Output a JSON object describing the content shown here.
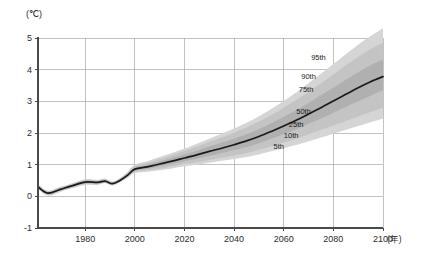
{
  "chart_data": {
    "type": "area",
    "title": "",
    "subtitle": "",
    "xlabel": "(年)",
    "ylabel": "(℃)",
    "yunit": "℃",
    "xunit": "年",
    "xlim": [
      1961,
      2100
    ],
    "ylim": [
      -1,
      5
    ],
    "xticks": [
      1980,
      2000,
      2020,
      2040,
      2060,
      2080,
      2100
    ],
    "xtick_labels": [
      "1980",
      "2000",
      "2020",
      "2040",
      "2060",
      "2080",
      "2100"
    ],
    "yticks": [
      -1,
      0,
      1,
      2,
      3,
      4,
      5
    ],
    "ytick_labels": [
      "-1",
      "0",
      "1",
      "2",
      "3",
      "4",
      "5"
    ],
    "grid": true,
    "legend_position": "inline-annotations",
    "annotations": [
      {
        "label": "95th",
        "x": 2074,
        "y": 4.3
      },
      {
        "label": "90th",
        "x": 2070,
        "y": 3.7
      },
      {
        "label": "75th",
        "x": 2069,
        "y": 3.3
      },
      {
        "label": "50th",
        "x": 2068,
        "y": 2.6
      },
      {
        "label": "25th",
        "x": 2065,
        "y": 2.2
      },
      {
        "label": "10th",
        "x": 2063,
        "y": 1.85
      },
      {
        "label": "5th",
        "x": 2058,
        "y": 1.5
      }
    ],
    "x": [
      1961,
      1965,
      1970,
      1975,
      1980,
      1985,
      1988,
      1991,
      1994,
      1997,
      2000,
      2005,
      2010,
      2015,
      2020,
      2025,
      2030,
      2035,
      2040,
      2045,
      2050,
      2055,
      2060,
      2065,
      2070,
      2075,
      2080,
      2085,
      2090,
      2095,
      2100
    ],
    "series": [
      {
        "name": "5th",
        "percentile": 5,
        "values": [
          0.22,
          0.02,
          0.14,
          0.26,
          0.36,
          0.36,
          0.42,
          0.34,
          0.44,
          0.58,
          0.74,
          0.78,
          0.82,
          0.88,
          0.95,
          1.0,
          1.06,
          1.12,
          1.18,
          1.24,
          1.32,
          1.42,
          1.52,
          1.62,
          1.74,
          1.86,
          1.98,
          2.1,
          2.22,
          2.34,
          2.46
        ]
      },
      {
        "name": "10th",
        "percentile": 10,
        "values": [
          0.24,
          0.04,
          0.16,
          0.28,
          0.38,
          0.38,
          0.43,
          0.36,
          0.46,
          0.6,
          0.77,
          0.82,
          0.87,
          0.94,
          1.02,
          1.08,
          1.15,
          1.22,
          1.29,
          1.37,
          1.47,
          1.58,
          1.7,
          1.82,
          1.96,
          2.1,
          2.24,
          2.38,
          2.52,
          2.66,
          2.8
        ]
      },
      {
        "name": "25th",
        "percentile": 25,
        "values": [
          0.27,
          0.07,
          0.19,
          0.31,
          0.41,
          0.41,
          0.45,
          0.38,
          0.48,
          0.63,
          0.81,
          0.87,
          0.94,
          1.02,
          1.11,
          1.19,
          1.28,
          1.37,
          1.46,
          1.56,
          1.68,
          1.82,
          1.97,
          2.12,
          2.29,
          2.46,
          2.64,
          2.82,
          3.0,
          3.18,
          3.36
        ]
      },
      {
        "name": "50th",
        "percentile": 50,
        "values": [
          0.3,
          0.1,
          0.22,
          0.34,
          0.45,
          0.44,
          0.48,
          0.4,
          0.5,
          0.66,
          0.86,
          0.93,
          1.02,
          1.11,
          1.21,
          1.31,
          1.42,
          1.52,
          1.63,
          1.75,
          1.89,
          2.05,
          2.22,
          2.4,
          2.6,
          2.8,
          3.01,
          3.22,
          3.43,
          3.62,
          3.78
        ]
      },
      {
        "name": "75th",
        "percentile": 75,
        "values": [
          0.33,
          0.13,
          0.25,
          0.37,
          0.49,
          0.47,
          0.51,
          0.42,
          0.53,
          0.7,
          0.91,
          1.0,
          1.1,
          1.21,
          1.32,
          1.44,
          1.57,
          1.69,
          1.82,
          1.96,
          2.12,
          2.31,
          2.51,
          2.72,
          2.95,
          3.19,
          3.43,
          3.68,
          3.92,
          4.14,
          4.32
        ]
      },
      {
        "name": "90th",
        "percentile": 90,
        "values": [
          0.36,
          0.16,
          0.28,
          0.4,
          0.52,
          0.5,
          0.54,
          0.45,
          0.56,
          0.74,
          0.96,
          1.06,
          1.18,
          1.3,
          1.43,
          1.57,
          1.72,
          1.86,
          2.01,
          2.17,
          2.36,
          2.57,
          2.8,
          3.04,
          3.3,
          3.57,
          3.85,
          4.13,
          4.4,
          4.65,
          4.86
        ]
      },
      {
        "name": "95th",
        "percentile": 95,
        "values": [
          0.38,
          0.18,
          0.3,
          0.42,
          0.54,
          0.52,
          0.56,
          0.47,
          0.58,
          0.77,
          1.0,
          1.11,
          1.24,
          1.37,
          1.51,
          1.66,
          1.82,
          1.98,
          2.14,
          2.32,
          2.53,
          2.76,
          3.01,
          3.28,
          3.57,
          3.87,
          4.18,
          4.49,
          4.79,
          5.06,
          5.3
        ]
      }
    ],
    "median_line": {
      "name": "median",
      "color": "#1a1a1a",
      "values": [
        0.3,
        0.1,
        0.22,
        0.34,
        0.45,
        0.44,
        0.48,
        0.4,
        0.5,
        0.66,
        0.86,
        0.93,
        1.02,
        1.11,
        1.21,
        1.31,
        1.42,
        1.52,
        1.63,
        1.75,
        1.89,
        2.05,
        2.22,
        2.4,
        2.6,
        2.8,
        3.01,
        3.22,
        3.43,
        3.62,
        3.78
      ]
    },
    "band_colors": {
      "outer_95": "#d5d5d5",
      "outer_90": "#c4c4c4",
      "mid_75": "#b0b0b0",
      "inner_50": "#9a9a9a",
      "grid": "#9a9a9a",
      "axis": "#4a4a4a",
      "line": "#1a1a1a"
    }
  }
}
